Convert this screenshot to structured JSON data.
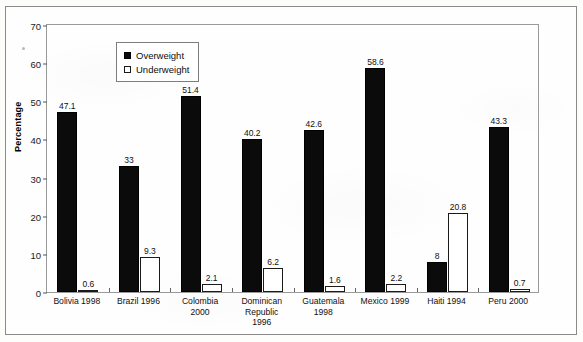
{
  "chart_data": {
    "type": "bar",
    "title": "",
    "xlabel": "",
    "ylabel": "Percentage",
    "ylim": [
      0,
      70
    ],
    "ytick_step": 10,
    "yticks": [
      0,
      10,
      20,
      30,
      40,
      50,
      60,
      70
    ],
    "grid": false,
    "legend_position": "upper-left-inside",
    "categories": [
      "Bolivia 1998",
      "Brazil 1996",
      "Colombia 2000",
      "Dominican Republic 1996",
      "Guatemala 1998",
      "Mexico 1999",
      "Haiti 1994",
      "Peru 2000"
    ],
    "category_lines": [
      [
        "Bolivia 1998"
      ],
      [
        "Brazil 1996"
      ],
      [
        "Colombia",
        "2000"
      ],
      [
        "Dominican",
        "Republic",
        "1996"
      ],
      [
        "Guatemala",
        "1998"
      ],
      [
        "Mexico 1999"
      ],
      [
        "Haiti 1994"
      ],
      [
        "Peru 2000"
      ]
    ],
    "series": [
      {
        "name": "Overweight",
        "color": "#0b0b0b",
        "values": [
          47.1,
          33,
          51.4,
          40.2,
          42.6,
          58.6,
          8,
          43.3
        ],
        "labels": [
          "47.1",
          "33",
          "51.4",
          "40.2",
          "42.6",
          "58.6",
          "8",
          "43.3"
        ]
      },
      {
        "name": "Underweight",
        "color": "#ffffff",
        "values": [
          0.6,
          9.3,
          2.1,
          6.2,
          1.6,
          2.2,
          20.8,
          0.7
        ],
        "labels": [
          "0.6",
          "9.3",
          "2.1",
          "6.2",
          "1.6",
          "2.2",
          "20.8",
          "0.7"
        ]
      }
    ]
  },
  "legend": {
    "items": [
      {
        "label": "Overweight",
        "swatch": "filled-square-icon"
      },
      {
        "label": "Underweight",
        "swatch": "hollow-square-icon"
      }
    ]
  }
}
